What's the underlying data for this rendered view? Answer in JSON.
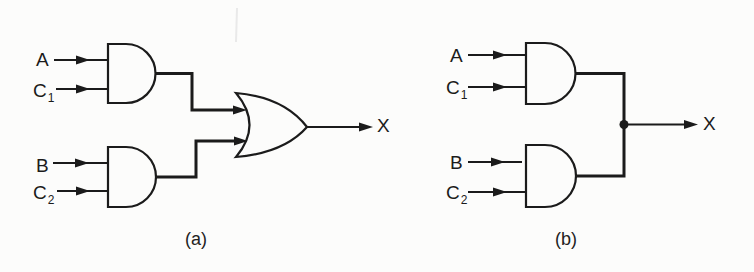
{
  "figure": {
    "background_color": "#fcfcfb",
    "ink_color": "#1b1b1b",
    "circuit_a": {
      "caption": "(a)",
      "gates": [
        "AND",
        "AND",
        "OR"
      ],
      "inputs": [
        {
          "base": "A",
          "sub": ""
        },
        {
          "base": "C",
          "sub": "1"
        },
        {
          "base": "B",
          "sub": ""
        },
        {
          "base": "C",
          "sub": "2"
        }
      ],
      "output_label": "X"
    },
    "circuit_b": {
      "caption": "(b)",
      "gates": [
        "AND",
        "AND"
      ],
      "junction": "wired-or-dot",
      "inputs": [
        {
          "base": "A",
          "sub": ""
        },
        {
          "base": "C",
          "sub": "1"
        },
        {
          "base": "B",
          "sub": ""
        },
        {
          "base": "C",
          "sub": "2"
        }
      ],
      "output_label": "X"
    }
  }
}
